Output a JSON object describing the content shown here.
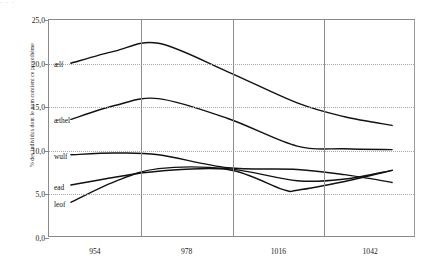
{
  "figure": {
    "top_edge_remnant": "·       ·              ·"
  },
  "chart_data": {
    "type": "line",
    "title": "",
    "xlabel": "",
    "ylabel": "% des individus dont le nom contient ce protothème",
    "ylim": [
      0.0,
      25.0
    ],
    "ytick_values": [
      0.0,
      5.0,
      10.0,
      15.0,
      20.0,
      25.0
    ],
    "ytick_labels": [
      "0,0",
      "5,0",
      "10,0",
      "15,0",
      "20,0",
      "25,0"
    ],
    "categories": [
      "954",
      "978",
      "1016",
      "1042"
    ],
    "grid": {
      "horizontal": "dotted",
      "vertical": "solid-category-separators"
    },
    "legend": {
      "position": "inline-left-of-curves"
    },
    "series": [
      {
        "name": "ælf",
        "label": "ælf",
        "label_value": 20.0,
        "values": [
          20.0,
          22.3,
          15.4,
          12.8
        ],
        "points": [
          {
            "x": 954,
            "y": 20.0
          },
          {
            "x": 966,
            "y": 21.4
          },
          {
            "x": 978,
            "y": 22.3
          },
          {
            "x": 997,
            "y": 19.0
          },
          {
            "x": 1016,
            "y": 15.4
          },
          {
            "x": 1029,
            "y": 13.8
          },
          {
            "x": 1042,
            "y": 12.8
          }
        ]
      },
      {
        "name": "æthel",
        "label": "æthel",
        "label_value": 13.5,
        "values": [
          13.5,
          15.9,
          10.4,
          10.0
        ],
        "points": [
          {
            "x": 954,
            "y": 13.5
          },
          {
            "x": 966,
            "y": 15.1
          },
          {
            "x": 978,
            "y": 15.9
          },
          {
            "x": 997,
            "y": 13.6
          },
          {
            "x": 1016,
            "y": 10.4
          },
          {
            "x": 1029,
            "y": 10.1
          },
          {
            "x": 1042,
            "y": 10.0
          }
        ]
      },
      {
        "name": "wulf",
        "label": "wulf",
        "label_value": 9.4,
        "values": [
          9.4,
          9.5,
          7.7,
          6.2
        ],
        "points": [
          {
            "x": 954,
            "y": 9.4
          },
          {
            "x": 966,
            "y": 9.6
          },
          {
            "x": 978,
            "y": 9.4
          },
          {
            "x": 997,
            "y": 7.9
          },
          {
            "x": 1016,
            "y": 7.7
          },
          {
            "x": 1029,
            "y": 7.1
          },
          {
            "x": 1042,
            "y": 6.2
          }
        ]
      },
      {
        "name": "ead",
        "label": "ead",
        "label_value": 5.9,
        "values": [
          5.9,
          7.5,
          5.3,
          7.6
        ],
        "points": [
          {
            "x": 954,
            "y": 5.9
          },
          {
            "x": 966,
            "y": 6.8
          },
          {
            "x": 978,
            "y": 7.5
          },
          {
            "x": 997,
            "y": 7.7
          },
          {
            "x": 1012,
            "y": 5.4
          },
          {
            "x": 1016,
            "y": 5.3
          },
          {
            "x": 1029,
            "y": 6.3
          },
          {
            "x": 1042,
            "y": 7.6
          }
        ]
      },
      {
        "name": "leof",
        "label": "leof",
        "label_value": 3.9,
        "values": [
          3.9,
          7.8,
          6.4,
          7.6
        ],
        "points": [
          {
            "x": 954,
            "y": 3.9
          },
          {
            "x": 966,
            "y": 6.3
          },
          {
            "x": 978,
            "y": 7.8
          },
          {
            "x": 997,
            "y": 7.8
          },
          {
            "x": 1016,
            "y": 6.4
          },
          {
            "x": 1029,
            "y": 6.6
          },
          {
            "x": 1042,
            "y": 7.6
          }
        ]
      }
    ]
  }
}
